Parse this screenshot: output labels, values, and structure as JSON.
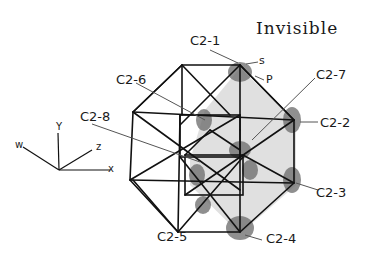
{
  "title": "Invisible",
  "labels": {
    "c2_1": "C2-1",
    "c2_2": "C2-2",
    "c2_3": "C2-3",
    "c2_4": "C2-4",
    "c2_5": "C2-5",
    "c2_6": "C2-6",
    "c2_7": "C2-7",
    "c2_8": "C2-8",
    "s": "s",
    "p": "P"
  },
  "axes": {
    "x": "x",
    "y": "Y",
    "z": "z",
    "w": "w"
  },
  "colors": {
    "ink": "#111111",
    "shade_light": "#d9d9d9",
    "shade_dark": "#6a6a6a",
    "leader": "#555555"
  }
}
